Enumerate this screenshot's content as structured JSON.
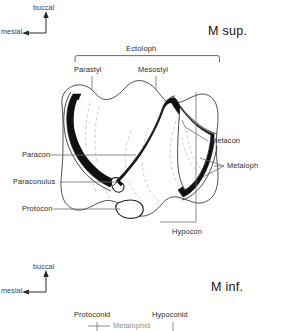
{
  "figure": {
    "width": 281,
    "height": 331,
    "background": "#ffffff",
    "ink": "#1a1a1a",
    "leader_color": "#6e6e6e",
    "dash_color": "#b9b9b9"
  },
  "upper": {
    "section_label": "M sup.",
    "compass": {
      "up_label": "buccal",
      "left_label": "mesial"
    },
    "bracket_label": "Ectoloph",
    "top_labels": [
      {
        "text": "Parastyl"
      },
      {
        "text": "Mesostyl"
      }
    ],
    "left_labels": [
      {
        "text": "Paracon"
      },
      {
        "text": "Paraconulus"
      },
      {
        "text": "Protocon"
      }
    ],
    "right_labels": [
      {
        "text": "Metacon"
      },
      {
        "text": "Metaloph"
      }
    ],
    "bottom_labels": [
      {
        "text": "Hypocon"
      }
    ]
  },
  "lower": {
    "section_label": "M inf.",
    "compass": {
      "up_label": "buccal",
      "left_label": "mesial"
    },
    "labels": [
      {
        "text": "Protoconid"
      },
      {
        "text": "Metalophid"
      },
      {
        "text": "Hypoconid"
      }
    ]
  }
}
